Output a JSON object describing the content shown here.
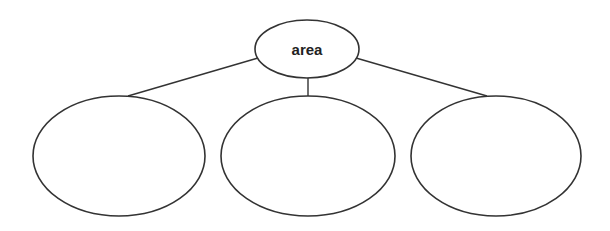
{
  "diagram": {
    "type": "tree",
    "stroke_color": "#333333",
    "background": "#ffffff",
    "root": {
      "label": "area",
      "cx": 307,
      "cy": 49,
      "rx": 52,
      "ry": 29
    },
    "children": [
      {
        "label": "",
        "cx": 119,
        "cy": 156,
        "rx": 86,
        "ry": 60
      },
      {
        "label": "",
        "cx": 308,
        "cy": 156,
        "rx": 87,
        "ry": 60
      },
      {
        "label": "",
        "cx": 496,
        "cy": 156,
        "rx": 85,
        "ry": 60
      }
    ],
    "edges": [
      {
        "from": "root",
        "to": 0,
        "x1": 258,
        "y1": 58,
        "x2": 128,
        "y2": 96
      },
      {
        "from": "root",
        "to": 1,
        "x1": 308,
        "y1": 78,
        "x2": 308,
        "y2": 96
      },
      {
        "from": "root",
        "to": 2,
        "x1": 356,
        "y1": 58,
        "x2": 487,
        "y2": 96
      }
    ]
  }
}
